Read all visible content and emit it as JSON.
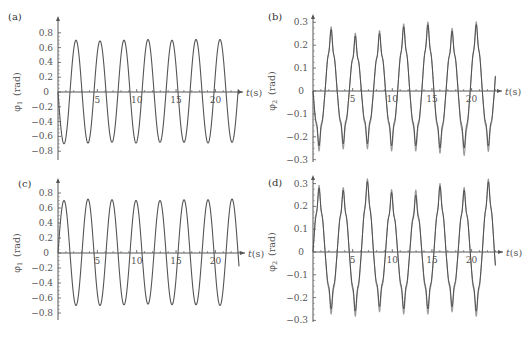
{
  "chart_data": [
    {
      "id": "a",
      "panel_label": "(a)",
      "type": "line",
      "ylabel": "φ1 (rad)",
      "ylabel_main": "φ",
      "ylabel_sub": "1",
      "ylabel_unit": "(rad)",
      "xlabel": "t (s)",
      "xlabel_var": "t",
      "xlabel_unit": "(s)",
      "xticks": [
        5,
        10,
        15,
        20
      ],
      "yticks": [
        0.8,
        0.6,
        0.4,
        0.2,
        0,
        -0.2,
        -0.4,
        -0.6,
        -0.8
      ],
      "ytick_labels": [
        "0.8",
        "0.6",
        "0.4",
        "0.2",
        "0",
        "−0.2",
        "−0.4",
        "−0.6",
        "−0.8"
      ],
      "ylim": [
        -0.85,
        0.88
      ],
      "xlim": [
        0,
        23
      ],
      "layout": {
        "x0": 58,
        "y0": 92,
        "px_per_s": 7.87,
        "px_per_unit": 74,
        "axis_end_x": 243,
        "ytop": 22,
        "ybot": 160,
        "label_x": 8,
        "label_y": 20
      },
      "series": [
        {
          "name": "response",
          "color": "#555555",
          "amplitude": 0.7,
          "period": 3.05,
          "phase_sign": -1,
          "harmonic_amp": 0,
          "harmonic_order": 5,
          "t_end": 22.9,
          "peaks_t": [
            2.4,
            5.4,
            8.4,
            11.4,
            14.5,
            17.5,
            20.6
          ],
          "peaks_v": [
            0.7,
            0.69,
            0.7,
            0.71,
            0.7,
            0.71,
            0.71
          ],
          "troughs_t": [
            0.9,
            3.9,
            6.9,
            10.0,
            13.0,
            16.1,
            19.1,
            22.1
          ],
          "troughs_v": [
            -0.7,
            -0.69,
            -0.68,
            -0.69,
            -0.68,
            -0.68,
            -0.69,
            -0.68
          ]
        }
      ]
    },
    {
      "id": "b",
      "panel_label": "(b)",
      "type": "line",
      "ylabel": "φ2 (rad)",
      "ylabel_main": "φ",
      "ylabel_sub": "2",
      "ylabel_unit": "(rad)",
      "xlabel": "t (s)",
      "xlabel_var": "t",
      "xlabel_unit": "(s)",
      "xticks": [
        5,
        10,
        15,
        20
      ],
      "yticks": [
        0.3,
        0.2,
        0.1,
        0,
        -0.1,
        -0.2,
        -0.3
      ],
      "ytick_labels": [
        "0.3",
        "0.2",
        "0.1",
        "0",
        "−0.1",
        "−0.2",
        "−0.3"
      ],
      "ylim": [
        -0.31,
        0.32
      ],
      "xlim": [
        0,
        23
      ],
      "layout": {
        "x0": 313,
        "y0": 91,
        "px_per_s": 7.93,
        "px_per_unit": 229,
        "axis_end_x": 502,
        "ytop": 20,
        "ybot": 162,
        "label_x": 268,
        "label_y": 20
      },
      "series": [
        {
          "name": "simulated",
          "color": "#9a9a9a",
          "amplitude": 0.215,
          "period": 3.05,
          "phase_sign": -1,
          "harmonic_amp": 0.045,
          "harmonic_order": 5,
          "t_end": 23.0,
          "peaks_t": [
            2.1,
            5.2,
            8.2,
            11.2,
            14.4,
            17.4,
            20.6
          ],
          "peaks_v": [
            0.26,
            0.23,
            0.24,
            0.27,
            0.28,
            0.25,
            0.28
          ],
          "troughs_t": [
            1.0,
            4.0,
            7.1,
            10.1,
            13.2,
            16.2,
            19.3,
            22.3
          ],
          "troughs_v": [
            -0.24,
            -0.23,
            -0.23,
            -0.24,
            -0.24,
            -0.25,
            -0.26,
            -0.24
          ]
        },
        {
          "name": "measured",
          "color": "#444444",
          "amplitude": 0.2,
          "period": 3.05,
          "phase_sign": -1,
          "harmonic_amp": 0.04,
          "harmonic_order": 5,
          "t_end": 23.0,
          "peaks_t": [
            2.1,
            5.2,
            8.2,
            11.2,
            14.4,
            17.4,
            20.6
          ],
          "peaks_v": [
            0.25,
            0.22,
            0.23,
            0.26,
            0.27,
            0.24,
            0.27
          ],
          "troughs_t": [
            1.0,
            4.0,
            7.1,
            10.1,
            13.2,
            16.2,
            19.3,
            22.3
          ],
          "troughs_v": [
            -0.22,
            -0.21,
            -0.21,
            -0.22,
            -0.22,
            -0.23,
            -0.23,
            -0.22
          ]
        }
      ]
    },
    {
      "id": "c",
      "panel_label": "(c)",
      "type": "line",
      "ylabel": "φ1 (rad)",
      "ylabel_main": "φ",
      "ylabel_sub": "1",
      "ylabel_unit": "(rad)",
      "xlabel": "t (s)",
      "xlabel_var": "t",
      "xlabel_unit": "(s)",
      "xticks": [
        5,
        10,
        15,
        20
      ],
      "yticks": [
        0.8,
        0.6,
        0.4,
        0.2,
        0,
        -0.2,
        -0.4,
        -0.6,
        -0.8
      ],
      "ytick_labels": [
        "0.8",
        "0.6",
        "0.4",
        "0.2",
        "0",
        "−0.2",
        "−0.4",
        "−0.6",
        "−0.8"
      ],
      "ylim": [
        -0.85,
        0.88
      ],
      "xlim": [
        0,
        23
      ],
      "layout": {
        "x0": 58,
        "y0": 253,
        "px_per_s": 7.87,
        "px_per_unit": 75,
        "axis_end_x": 245,
        "ytop": 184,
        "ybot": 320,
        "label_x": 18,
        "label_y": 187
      },
      "series": [
        {
          "name": "response",
          "color": "#555555",
          "amplitude": 0.71,
          "period": 3.05,
          "phase_sign": 1,
          "harmonic_amp": 0,
          "harmonic_order": 5,
          "t_end": 23.0,
          "peaks_t": [
            1.0,
            4.1,
            7.1,
            10.2,
            13.2,
            16.2,
            19.3,
            22.4
          ],
          "peaks_v": [
            0.7,
            0.72,
            0.71,
            0.7,
            0.7,
            0.71,
            0.71,
            0.72
          ],
          "troughs_t": [
            2.5,
            5.6,
            8.6,
            11.7,
            14.7,
            17.7,
            20.8
          ],
          "troughs_v": [
            -0.7,
            -0.7,
            -0.69,
            -0.68,
            -0.69,
            -0.69,
            -0.7
          ]
        }
      ]
    },
    {
      "id": "d",
      "panel_label": "(d)",
      "type": "line",
      "ylabel": "φ2 (rad)",
      "ylabel_main": "φ",
      "ylabel_sub": "2",
      "ylabel_unit": "(rad)",
      "xlabel": "t (s)",
      "xlabel_var": "t",
      "xlabel_unit": "(s)",
      "xticks": [
        5,
        10,
        15,
        20
      ],
      "yticks": [
        0.3,
        0.2,
        0.1,
        0,
        -0.1,
        -0.2,
        -0.3
      ],
      "ytick_labels": [
        "0.3",
        "0.2",
        "0.1",
        "0",
        "−0.1",
        "−0.2",
        "−0.3"
      ],
      "ylim": [
        -0.31,
        0.32
      ],
      "xlim": [
        0,
        23
      ],
      "layout": {
        "x0": 313,
        "y0": 252,
        "px_per_s": 7.93,
        "px_per_unit": 228,
        "axis_end_x": 503,
        "ytop": 181,
        "ybot": 322,
        "label_x": 268,
        "label_y": 186
      },
      "series": [
        {
          "name": "simulated",
          "color": "#9a9a9a",
          "amplitude": 0.215,
          "period": 3.05,
          "phase_sign": 1,
          "harmonic_amp": 0.045,
          "harmonic_order": 5,
          "t_end": 23.0,
          "peaks_t": [
            0.8,
            3.8,
            6.8,
            10.0,
            13.0,
            16.2,
            19.2,
            22.3
          ],
          "peaks_v": [
            0.27,
            0.26,
            0.3,
            0.25,
            0.25,
            0.28,
            0.26,
            0.3
          ],
          "troughs_t": [
            2.3,
            5.3,
            8.4,
            11.5,
            14.5,
            17.6,
            20.6
          ],
          "troughs_v": [
            -0.25,
            -0.26,
            -0.24,
            -0.25,
            -0.25,
            -0.24,
            -0.26
          ]
        },
        {
          "name": "measured",
          "color": "#444444",
          "amplitude": 0.2,
          "period": 3.05,
          "phase_sign": 1,
          "harmonic_amp": 0.04,
          "harmonic_order": 5,
          "t_end": 23.0,
          "peaks_t": [
            0.8,
            3.8,
            6.8,
            10.0,
            13.0,
            16.2,
            19.2,
            22.3
          ],
          "peaks_v": [
            0.26,
            0.25,
            0.29,
            0.24,
            0.23,
            0.27,
            0.25,
            0.29
          ],
          "troughs_t": [
            2.3,
            5.3,
            8.4,
            11.5,
            14.5,
            17.6,
            20.6
          ],
          "troughs_v": [
            -0.23,
            -0.24,
            -0.22,
            -0.23,
            -0.23,
            -0.22,
            -0.24
          ]
        }
      ]
    }
  ]
}
